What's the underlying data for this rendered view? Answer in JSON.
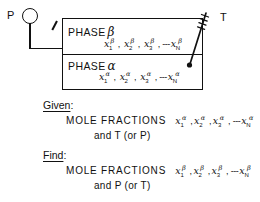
{
  "diagram": {
    "gauge": {
      "label": "P",
      "icon": "pressure-gauge-icon"
    },
    "thermometer": {
      "label": "T",
      "icon": "thermometer-icon"
    },
    "vessel": {
      "phases": [
        {
          "id": "beta",
          "name": "PHASE",
          "symbol": "β",
          "composition": {
            "base": "x",
            "subscripts": [
              "1",
              "2",
              "3",
              "N"
            ],
            "superscript": "β",
            "separator": ",",
            "ellipsis": "---"
          }
        },
        {
          "id": "alpha",
          "name": "PHASE",
          "symbol": "α",
          "composition": {
            "base": "x",
            "subscripts": [
              "1",
              "2",
              "3",
              "N"
            ],
            "superscript": "α",
            "separator": ",",
            "ellipsis": "---"
          }
        }
      ]
    },
    "given": {
      "heading": "Given",
      "colon": ":",
      "line1_label": "MOLE  FRACTIONS",
      "line1_vars": {
        "base": "x",
        "subscripts": [
          "1",
          "2",
          "3",
          "N"
        ],
        "superscript": "α",
        "separator": ",",
        "ellipsis": "---"
      },
      "line2": "and   T (or P)"
    },
    "find": {
      "heading": "Find",
      "colon": ":",
      "line1_label": "MOLE  FRACTIONS",
      "line1_vars": {
        "base": "x",
        "subscripts": [
          "1",
          "2",
          "3",
          "N"
        ],
        "superscript": "β",
        "separator": ",",
        "ellipsis": "---"
      },
      "line2": "and   P (or T)"
    },
    "colors": {
      "ink": "#111111",
      "background": "#ffffff"
    }
  }
}
